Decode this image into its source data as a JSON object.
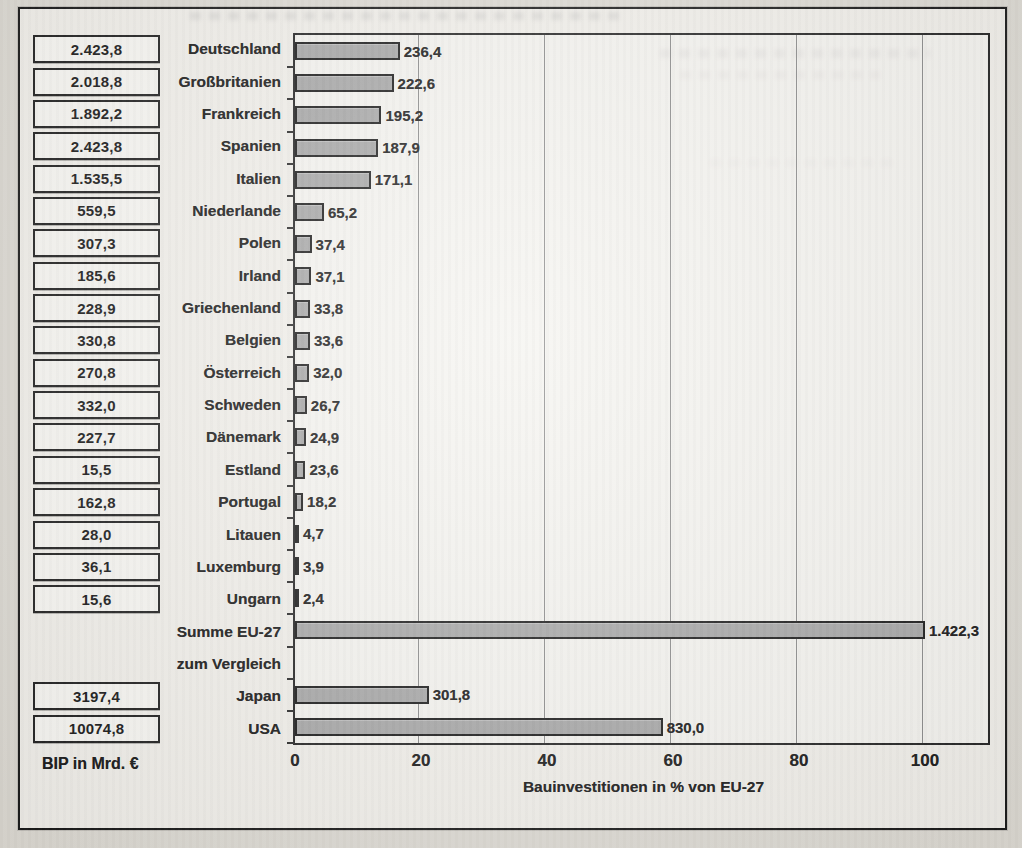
{
  "page": {
    "bip_caption": "BIP in Mrd. €"
  },
  "chart_data": {
    "type": "bar",
    "title": "",
    "xlabel": "Bauinvestitionen in % von EU-27",
    "x_ticks": [
      0,
      20,
      40,
      60,
      80,
      100
    ],
    "xlim": [
      0,
      110
    ],
    "grid": true,
    "eu27_total": 1422.3,
    "rows": [
      {
        "label": "Deutschland",
        "bip": "2.423,8",
        "value_label": "236,4",
        "value": 236.4,
        "bold": false
      },
      {
        "label": "Großbritanien",
        "bip": "2.018,8",
        "value_label": "222,6",
        "value": 222.6,
        "bold": false
      },
      {
        "label": "Frankreich",
        "bip": "1.892,2",
        "value_label": "195,2",
        "value": 195.2,
        "bold": false
      },
      {
        "label": "Spanien",
        "bip": "2.423,8",
        "value_label": "187,9",
        "value": 187.9,
        "bold": false
      },
      {
        "label": "Italien",
        "bip": "1.535,5",
        "value_label": "171,1",
        "value": 171.1,
        "bold": false
      },
      {
        "label": "Niederlande",
        "bip": "559,5",
        "value_label": "65,2",
        "value": 65.2,
        "bold": false
      },
      {
        "label": "Polen",
        "bip": "307,3",
        "value_label": "37,4",
        "value": 37.4,
        "bold": false
      },
      {
        "label": "Irland",
        "bip": "185,6",
        "value_label": "37,1",
        "value": 37.1,
        "bold": false
      },
      {
        "label": "Griechenland",
        "bip": "228,9",
        "value_label": "33,8",
        "value": 33.8,
        "bold": false
      },
      {
        "label": "Belgien",
        "bip": "330,8",
        "value_label": "33,6",
        "value": 33.6,
        "bold": false
      },
      {
        "label": "Österreich",
        "bip": "270,8",
        "value_label": "32,0",
        "value": 32.0,
        "bold": false
      },
      {
        "label": "Schweden",
        "bip": "332,0",
        "value_label": "26,7",
        "value": 26.7,
        "bold": false
      },
      {
        "label": "Dänemark",
        "bip": "227,7",
        "value_label": "24,9",
        "value": 24.9,
        "bold": false
      },
      {
        "label": "Estland",
        "bip": "15,5",
        "value_label": "23,6",
        "value": 23.6,
        "bold": false
      },
      {
        "label": "Portugal",
        "bip": "162,8",
        "value_label": "18,2",
        "value": 18.2,
        "bold": false
      },
      {
        "label": "Litauen",
        "bip": "28,0",
        "value_label": "4,7",
        "value": 4.7,
        "bold": false
      },
      {
        "label": "Luxemburg",
        "bip": "36,1",
        "value_label": "3,9",
        "value": 3.9,
        "bold": false
      },
      {
        "label": "Ungarn",
        "bip": "15,6",
        "value_label": "2,4",
        "value": 2.4,
        "bold": false
      },
      {
        "label": "Summe EU-27",
        "bip": null,
        "value_label": "1.422,3",
        "value": 1422.3,
        "bold": true
      },
      {
        "label": "zum Vergleich",
        "bip": null,
        "value_label": null,
        "value": null,
        "bold": false
      },
      {
        "label": "Japan",
        "bip": "3197,4",
        "value_label": "301,8",
        "value": 301.8,
        "bold": false
      },
      {
        "label": "USA",
        "bip": "10074,8",
        "value_label": "830,0",
        "value": 830.0,
        "bold": false
      }
    ]
  },
  "colors": {
    "bar_fill": "#a8a8a8",
    "bar_border": "#1c1c1c",
    "frame_border": "#1a1a1a",
    "paper": "#f2f0eb"
  }
}
